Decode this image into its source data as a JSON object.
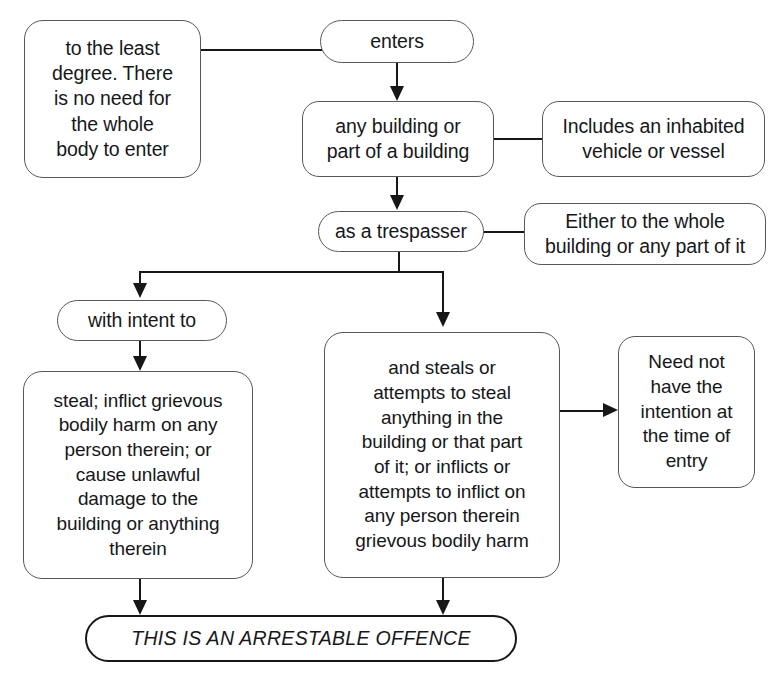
{
  "diagram": {
    "top_clipped_caption": "",
    "colors": {
      "box_border": "#58585a",
      "emphasis_border": "#17171a",
      "connector": "#17171a",
      "text": "#17171a",
      "background": "#ffffff"
    },
    "nodes": [
      {
        "id": "least-degree",
        "label": "to the least\ndegree. There\nis no need for\nthe whole\nbody to enter",
        "shape": "rounded-rect",
        "role": "annotation"
      },
      {
        "id": "enters",
        "label": "enters",
        "shape": "stadium",
        "role": "element"
      },
      {
        "id": "building",
        "label": "any building or\npart of a building",
        "shape": "rounded-rect",
        "role": "element"
      },
      {
        "id": "vehicle",
        "label": "Includes an inhabited\nvehicle or vessel",
        "shape": "rounded-rect",
        "role": "annotation"
      },
      {
        "id": "trespasser",
        "label": "as a trespasser",
        "shape": "stadium",
        "role": "element"
      },
      {
        "id": "either",
        "label": "Either to the whole\nbuilding or any part of it",
        "shape": "rounded-rect",
        "role": "annotation"
      },
      {
        "id": "intent",
        "label": "with intent to",
        "shape": "stadium",
        "role": "element"
      },
      {
        "id": "steal-list",
        "label": "steal; inflict grievous\nbodily harm on any\nperson therein; or\ncause unlawful\ndamage to the\nbuilding or anything\ntherein",
        "shape": "rounded-rect",
        "role": "element"
      },
      {
        "id": "steals",
        "label": "and steals or\nattempts to steal\nanything in the\nbuilding or that part\nof it; or inflicts or\nattempts to inflict on\nany person therein\ngrievous bodily harm",
        "shape": "rounded-rect",
        "role": "element"
      },
      {
        "id": "need-not",
        "label": "Need not\nhave the\nintention at\nthe time of\nentry",
        "shape": "rounded-rect",
        "role": "annotation"
      },
      {
        "id": "arrestable",
        "label": "THIS IS AN ARRESTABLE OFFENCE",
        "shape": "stadium",
        "role": "outcome"
      }
    ],
    "edges": [
      {
        "from": "least-degree",
        "to": "enters",
        "kind": "plain"
      },
      {
        "from": "enters",
        "to": "building",
        "kind": "arrow-down"
      },
      {
        "from": "building",
        "to": "vehicle",
        "kind": "plain"
      },
      {
        "from": "building",
        "to": "trespasser",
        "kind": "arrow-down"
      },
      {
        "from": "trespasser",
        "to": "either",
        "kind": "plain"
      },
      {
        "from": "trespasser",
        "to": "intent",
        "kind": "arrow-down-branch-left"
      },
      {
        "from": "trespasser",
        "to": "steals",
        "kind": "arrow-down-branch-right"
      },
      {
        "from": "intent",
        "to": "steal-list",
        "kind": "arrow-down"
      },
      {
        "from": "steals",
        "to": "need-not",
        "kind": "arrow-right"
      },
      {
        "from": "steal-list",
        "to": "arrestable",
        "kind": "arrow-down"
      },
      {
        "from": "steals",
        "to": "arrestable",
        "kind": "arrow-down"
      }
    ]
  }
}
